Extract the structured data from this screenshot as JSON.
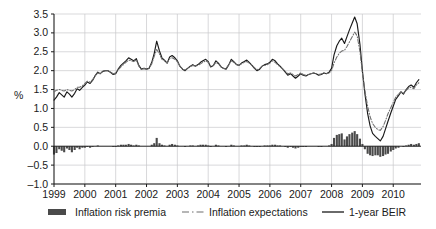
{
  "chart_data": {
    "type": "line",
    "title": "",
    "subtitle": "",
    "xlabel": "",
    "ylabel": "%",
    "ylim": [
      -1.0,
      3.5
    ],
    "xlim": [
      1999.0,
      2010.9
    ],
    "grid": true,
    "y_ticks": [
      "3.5",
      "3.0",
      "2.5",
      "2.0",
      "1.5",
      "1.0",
      "0.5",
      "0.0",
      "–0.5",
      "–1.0"
    ],
    "y_tick_values": [
      3.5,
      3.0,
      2.5,
      2.0,
      1.5,
      1.0,
      0.5,
      0.0,
      -0.5,
      -1.0
    ],
    "x_ticks": [
      "1999",
      "2000",
      "2001",
      "2002",
      "2003",
      "2004",
      "2005",
      "2006",
      "2007",
      "2008",
      "2009",
      "2010"
    ],
    "x_tick_values": [
      1999,
      2000,
      2001,
      2002,
      2003,
      2004,
      2005,
      2006,
      2007,
      2008,
      2009,
      2010
    ],
    "legend_position": "bottom",
    "colors": {
      "bars": "#4a4a4a",
      "expectations": "#6e6e6e",
      "beir": "#1a1a1a",
      "grid": "#c8c8cc",
      "axis": "#1a1a1a",
      "background": "#ffffff"
    },
    "legend": [
      {
        "label": "Inflation risk premia",
        "style": "bar",
        "color": "#4a4a4a"
      },
      {
        "label": "Inflation expectations",
        "style": "dashdot",
        "color": "#6e6e6e"
      },
      {
        "label": "1-year BEIR",
        "style": "solid",
        "color": "#1a1a1a"
      }
    ],
    "series": [
      {
        "name": "1-year BEIR",
        "style": "solid",
        "color": "#1a1a1a",
        "x": [
          1999.0,
          1999.08,
          1999.17,
          1999.25,
          1999.33,
          1999.42,
          1999.5,
          1999.58,
          1999.67,
          1999.75,
          1999.83,
          1999.92,
          2000.0,
          2000.08,
          2000.17,
          2000.25,
          2000.33,
          2000.42,
          2000.5,
          2000.58,
          2000.67,
          2000.75,
          2000.83,
          2000.92,
          2001.0,
          2001.08,
          2001.17,
          2001.25,
          2001.33,
          2001.42,
          2001.5,
          2001.58,
          2001.67,
          2001.75,
          2001.83,
          2001.92,
          2002.0,
          2002.08,
          2002.17,
          2002.25,
          2002.33,
          2002.42,
          2002.5,
          2002.58,
          2002.67,
          2002.75,
          2002.83,
          2002.92,
          2003.0,
          2003.08,
          2003.17,
          2003.25,
          2003.33,
          2003.42,
          2003.5,
          2003.58,
          2003.67,
          2003.75,
          2003.83,
          2003.92,
          2004.0,
          2004.08,
          2004.17,
          2004.25,
          2004.33,
          2004.42,
          2004.5,
          2004.58,
          2004.67,
          2004.75,
          2004.83,
          2004.92,
          2005.0,
          2005.08,
          2005.17,
          2005.25,
          2005.33,
          2005.42,
          2005.5,
          2005.58,
          2005.67,
          2005.75,
          2005.83,
          2005.92,
          2006.0,
          2006.08,
          2006.17,
          2006.25,
          2006.33,
          2006.42,
          2006.5,
          2006.58,
          2006.67,
          2006.75,
          2006.83,
          2006.92,
          2007.0,
          2007.08,
          2007.17,
          2007.25,
          2007.33,
          2007.42,
          2007.5,
          2007.58,
          2007.67,
          2007.75,
          2007.83,
          2007.92,
          2008.0,
          2008.08,
          2008.17,
          2008.25,
          2008.33,
          2008.42,
          2008.5,
          2008.58,
          2008.67,
          2008.75,
          2008.83,
          2008.92,
          2009.0,
          2009.08,
          2009.17,
          2009.25,
          2009.33,
          2009.42,
          2009.5,
          2009.58,
          2009.67,
          2009.75,
          2009.83,
          2009.92,
          2010.0,
          2010.08,
          2010.17,
          2010.25,
          2010.33,
          2010.42,
          2010.5,
          2010.58,
          2010.67,
          2010.75,
          2010.83
        ],
        "y": [
          1.22,
          1.3,
          1.42,
          1.36,
          1.3,
          1.44,
          1.38,
          1.3,
          1.4,
          1.52,
          1.48,
          1.56,
          1.62,
          1.7,
          1.66,
          1.74,
          1.86,
          1.96,
          1.92,
          1.98,
          2.0,
          2.0,
          1.96,
          1.9,
          1.92,
          2.04,
          2.14,
          2.2,
          2.26,
          2.34,
          2.3,
          2.26,
          2.32,
          2.14,
          2.04,
          2.06,
          2.04,
          2.06,
          2.22,
          2.46,
          2.78,
          2.52,
          2.34,
          2.28,
          2.2,
          2.36,
          2.4,
          2.34,
          2.26,
          2.12,
          2.04,
          2.0,
          2.06,
          2.12,
          2.16,
          2.12,
          2.16,
          2.22,
          2.26,
          2.3,
          2.24,
          2.1,
          2.14,
          2.26,
          2.2,
          2.1,
          2.06,
          2.04,
          2.16,
          2.3,
          2.24,
          2.16,
          2.14,
          2.2,
          2.24,
          2.28,
          2.22,
          2.14,
          2.06,
          2.0,
          2.04,
          2.12,
          2.16,
          2.18,
          2.22,
          2.3,
          2.26,
          2.18,
          2.12,
          2.04,
          1.96,
          1.88,
          1.92,
          1.86,
          1.8,
          1.86,
          1.92,
          1.88,
          1.86,
          1.9,
          1.92,
          1.94,
          1.92,
          1.88,
          1.9,
          1.94,
          1.92,
          1.96,
          2.06,
          2.42,
          2.66,
          2.78,
          2.86,
          2.72,
          2.9,
          3.08,
          3.26,
          3.42,
          3.24,
          2.7,
          2.0,
          1.4,
          0.86,
          0.54,
          0.34,
          0.26,
          0.2,
          0.14,
          0.26,
          0.46,
          0.66,
          0.88,
          1.06,
          1.24,
          1.34,
          1.44,
          1.38,
          1.5,
          1.58,
          1.62,
          1.56,
          1.68,
          1.76
        ]
      },
      {
        "name": "Inflation expectations",
        "style": "dashdot",
        "color": "#6e6e6e",
        "x": [
          1999.0,
          1999.08,
          1999.17,
          1999.25,
          1999.33,
          1999.42,
          1999.5,
          1999.58,
          1999.67,
          1999.75,
          1999.83,
          1999.92,
          2000.0,
          2000.08,
          2000.17,
          2000.25,
          2000.33,
          2000.42,
          2000.5,
          2000.58,
          2000.67,
          2000.75,
          2000.83,
          2000.92,
          2001.0,
          2001.08,
          2001.17,
          2001.25,
          2001.33,
          2001.42,
          2001.5,
          2001.58,
          2001.67,
          2001.75,
          2001.83,
          2001.92,
          2002.0,
          2002.08,
          2002.17,
          2002.25,
          2002.33,
          2002.42,
          2002.5,
          2002.58,
          2002.67,
          2002.75,
          2002.83,
          2002.92,
          2003.0,
          2003.08,
          2003.17,
          2003.25,
          2003.33,
          2003.42,
          2003.5,
          2003.58,
          2003.67,
          2003.75,
          2003.83,
          2003.92,
          2004.0,
          2004.08,
          2004.17,
          2004.25,
          2004.33,
          2004.42,
          2004.5,
          2004.58,
          2004.67,
          2004.75,
          2004.83,
          2004.92,
          2005.0,
          2005.08,
          2005.17,
          2005.25,
          2005.33,
          2005.42,
          2005.5,
          2005.58,
          2005.67,
          2005.75,
          2005.83,
          2005.92,
          2006.0,
          2006.08,
          2006.17,
          2006.25,
          2006.33,
          2006.42,
          2006.5,
          2006.58,
          2006.67,
          2006.75,
          2006.83,
          2006.92,
          2007.0,
          2007.08,
          2007.17,
          2007.25,
          2007.33,
          2007.42,
          2007.5,
          2007.58,
          2007.67,
          2007.75,
          2007.83,
          2007.92,
          2008.0,
          2008.08,
          2008.17,
          2008.25,
          2008.33,
          2008.42,
          2008.5,
          2008.58,
          2008.67,
          2008.75,
          2008.83,
          2008.92,
          2009.0,
          2009.08,
          2009.17,
          2009.25,
          2009.33,
          2009.42,
          2009.5,
          2009.58,
          2009.67,
          2009.75,
          2009.83,
          2009.92,
          2010.0,
          2010.08,
          2010.17,
          2010.25,
          2010.33,
          2010.42,
          2010.5,
          2010.58,
          2010.67,
          2010.75,
          2010.83
        ],
        "y": [
          1.44,
          1.48,
          1.5,
          1.48,
          1.46,
          1.5,
          1.48,
          1.46,
          1.5,
          1.56,
          1.56,
          1.6,
          1.66,
          1.72,
          1.7,
          1.76,
          1.86,
          1.94,
          1.92,
          1.98,
          2.0,
          2.0,
          1.96,
          1.92,
          1.94,
          2.02,
          2.1,
          2.16,
          2.22,
          2.28,
          2.26,
          2.24,
          2.28,
          2.12,
          2.04,
          2.06,
          2.04,
          2.06,
          2.18,
          2.38,
          2.56,
          2.44,
          2.3,
          2.26,
          2.2,
          2.32,
          2.34,
          2.3,
          2.24,
          2.12,
          2.04,
          2.02,
          2.06,
          2.1,
          2.14,
          2.12,
          2.14,
          2.18,
          2.22,
          2.26,
          2.22,
          2.12,
          2.14,
          2.22,
          2.18,
          2.1,
          2.06,
          2.06,
          2.16,
          2.26,
          2.22,
          2.16,
          2.14,
          2.18,
          2.22,
          2.24,
          2.2,
          2.14,
          2.08,
          2.02,
          2.06,
          2.12,
          2.14,
          2.16,
          2.2,
          2.26,
          2.22,
          2.16,
          2.1,
          2.04,
          1.98,
          1.92,
          1.94,
          1.9,
          1.86,
          1.9,
          1.94,
          1.9,
          1.88,
          1.9,
          1.92,
          1.94,
          1.92,
          1.9,
          1.92,
          1.94,
          1.92,
          1.94,
          2.0,
          2.2,
          2.36,
          2.46,
          2.52,
          2.54,
          2.64,
          2.76,
          2.9,
          3.02,
          2.92,
          2.5,
          1.94,
          1.48,
          1.06,
          0.78,
          0.6,
          0.5,
          0.44,
          0.42,
          0.52,
          0.68,
          0.86,
          1.02,
          1.16,
          1.3,
          1.38,
          1.44,
          1.4,
          1.48,
          1.54,
          1.56,
          1.52,
          1.62,
          1.68
        ]
      }
    ],
    "bar_series": {
      "name": "Inflation risk premia",
      "color": "#4a4a4a",
      "x": [
        1999.0,
        1999.08,
        1999.17,
        1999.25,
        1999.33,
        1999.42,
        1999.5,
        1999.58,
        1999.67,
        1999.75,
        1999.83,
        1999.92,
        2000.0,
        2000.08,
        2000.17,
        2000.25,
        2000.33,
        2000.42,
        2000.5,
        2000.58,
        2000.67,
        2000.75,
        2000.83,
        2000.92,
        2001.0,
        2001.08,
        2001.17,
        2001.25,
        2001.33,
        2001.42,
        2001.5,
        2001.58,
        2001.67,
        2001.75,
        2001.83,
        2001.92,
        2002.0,
        2002.08,
        2002.17,
        2002.25,
        2002.33,
        2002.42,
        2002.5,
        2002.58,
        2002.67,
        2002.75,
        2002.83,
        2002.92,
        2003.0,
        2003.08,
        2003.17,
        2003.25,
        2003.33,
        2003.42,
        2003.5,
        2003.58,
        2003.67,
        2003.75,
        2003.83,
        2003.92,
        2004.0,
        2004.08,
        2004.17,
        2004.25,
        2004.33,
        2004.42,
        2004.5,
        2004.58,
        2004.67,
        2004.75,
        2004.83,
        2004.92,
        2005.0,
        2005.08,
        2005.17,
        2005.25,
        2005.33,
        2005.42,
        2005.5,
        2005.58,
        2005.67,
        2005.75,
        2005.83,
        2005.92,
        2006.0,
        2006.08,
        2006.17,
        2006.25,
        2006.33,
        2006.42,
        2006.5,
        2006.58,
        2006.67,
        2006.75,
        2006.83,
        2006.92,
        2007.0,
        2007.08,
        2007.17,
        2007.25,
        2007.33,
        2007.42,
        2007.5,
        2007.58,
        2007.67,
        2007.75,
        2007.83,
        2007.92,
        2008.0,
        2008.08,
        2008.17,
        2008.25,
        2008.33,
        2008.42,
        2008.5,
        2008.58,
        2008.67,
        2008.75,
        2008.83,
        2008.92,
        2009.0,
        2009.08,
        2009.17,
        2009.25,
        2009.33,
        2009.42,
        2009.5,
        2009.58,
        2009.67,
        2009.75,
        2009.83,
        2009.92,
        2010.0,
        2010.08,
        2010.17,
        2010.25,
        2010.33,
        2010.42,
        2010.5,
        2010.58,
        2010.67,
        2010.75,
        2010.83
      ],
      "y": [
        -0.22,
        -0.18,
        -0.08,
        -0.12,
        -0.16,
        -0.06,
        -0.1,
        -0.16,
        -0.1,
        -0.04,
        -0.08,
        -0.04,
        -0.04,
        -0.02,
        -0.04,
        -0.02,
        0.0,
        0.02,
        0.0,
        0.0,
        0.0,
        0.0,
        0.0,
        -0.02,
        -0.02,
        0.02,
        0.04,
        0.04,
        0.04,
        0.06,
        0.04,
        0.02,
        0.04,
        0.02,
        0.0,
        0.0,
        0.0,
        0.0,
        0.04,
        0.08,
        0.22,
        0.08,
        0.04,
        0.02,
        0.0,
        0.04,
        0.06,
        0.04,
        0.02,
        0.0,
        0.0,
        -0.02,
        0.0,
        0.02,
        0.02,
        0.0,
        0.02,
        0.04,
        0.04,
        0.04,
        0.02,
        -0.02,
        0.0,
        0.04,
        0.02,
        0.0,
        0.0,
        -0.02,
        0.0,
        0.04,
        0.02,
        0.0,
        0.0,
        0.02,
        0.02,
        0.04,
        0.02,
        0.0,
        -0.02,
        -0.02,
        -0.02,
        0.0,
        0.02,
        0.02,
        0.02,
        0.04,
        0.04,
        0.02,
        0.02,
        0.0,
        -0.02,
        -0.04,
        -0.02,
        -0.04,
        -0.06,
        -0.04,
        -0.02,
        -0.02,
        -0.02,
        0.0,
        0.0,
        0.0,
        0.0,
        -0.02,
        -0.02,
        0.0,
        0.0,
        0.02,
        0.06,
        0.22,
        0.3,
        0.32,
        0.34,
        0.18,
        0.26,
        0.32,
        0.36,
        0.4,
        0.32,
        0.2,
        0.06,
        -0.08,
        -0.2,
        -0.24,
        -0.26,
        -0.24,
        -0.24,
        -0.28,
        -0.26,
        -0.22,
        -0.2,
        -0.14,
        -0.1,
        -0.06,
        -0.04,
        0.0,
        -0.02,
        0.02,
        0.04,
        0.06,
        0.04,
        0.06,
        0.08
      ]
    }
  }
}
